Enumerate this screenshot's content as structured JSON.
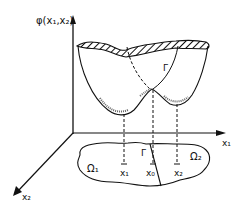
{
  "figure": {
    "type": "3D potential surface over a 2D domain",
    "axes": {
      "vertical_label": "φ(x₁,x₂)",
      "x1_label": "x₁",
      "x2_label": "x₂"
    },
    "surface": {
      "boundary_label": "Γ",
      "minima": 2,
      "saddle": "between the two wells"
    },
    "domain": {
      "region1_label": "Ω₁",
      "region2_label": "Ω₂",
      "interface_label": "Γ",
      "points": [
        {
          "label": "x₁"
        },
        {
          "label": "x₀"
        },
        {
          "label": "x₂"
        }
      ]
    },
    "colors": {
      "ink": "#111111",
      "background": "#ffffff"
    }
  }
}
